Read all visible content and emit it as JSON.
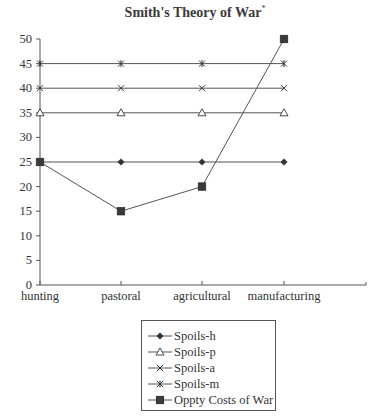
{
  "chart_data": {
    "type": "line",
    "title": "Smith's Theory of War",
    "title_footnote_marker": "*",
    "xlabel": "",
    "ylabel": "",
    "categories": [
      "hunting",
      "pastoral",
      "agricultural",
      "manufacturing"
    ],
    "ylim": [
      0,
      50
    ],
    "yticks": [
      0,
      5,
      10,
      15,
      20,
      25,
      30,
      35,
      40,
      45,
      50
    ],
    "grid": false,
    "legend_position": "bottom",
    "series": [
      {
        "name": "Spoils-h",
        "marker": "diamond",
        "values": [
          25,
          25,
          25,
          25
        ]
      },
      {
        "name": "Spoils-p",
        "marker": "triangle-open",
        "values": [
          35,
          35,
          35,
          35
        ]
      },
      {
        "name": "Spoils-a",
        "marker": "x",
        "values": [
          40,
          40,
          40,
          40
        ]
      },
      {
        "name": "Spoils-m",
        "marker": "star",
        "values": [
          45,
          45,
          45,
          45
        ]
      },
      {
        "name": "Oppty Costs of War",
        "marker": "square",
        "values": [
          25,
          15,
          20,
          50
        ]
      }
    ]
  },
  "colors": {
    "line": "#555555",
    "marker": "#333333",
    "text": "#333333"
  }
}
